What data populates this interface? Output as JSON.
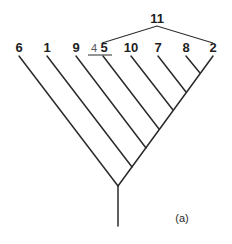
{
  "figure": {
    "caption": "(a)",
    "type": "cladogram",
    "group_label": "11",
    "group_members": [
      "4 5",
      "10",
      "7",
      "8",
      "2"
    ],
    "leaves": [
      {
        "label": "6",
        "x": 19
      },
      {
        "label": "1",
        "x": 47
      },
      {
        "label": "9",
        "x": 76
      },
      {
        "label": "5",
        "prefix": "4",
        "x": 102,
        "underlined": true
      },
      {
        "label": "10",
        "x": 131
      },
      {
        "label": "7",
        "x": 158
      },
      {
        "label": "8",
        "x": 186
      },
      {
        "label": "2",
        "x": 213
      }
    ],
    "order_along_spine": [
      "6",
      "1",
      "9",
      "5",
      "10",
      "7",
      "8",
      "2"
    ],
    "colors": {
      "line": "#2a2a2a",
      "background": "#ffffff"
    }
  }
}
